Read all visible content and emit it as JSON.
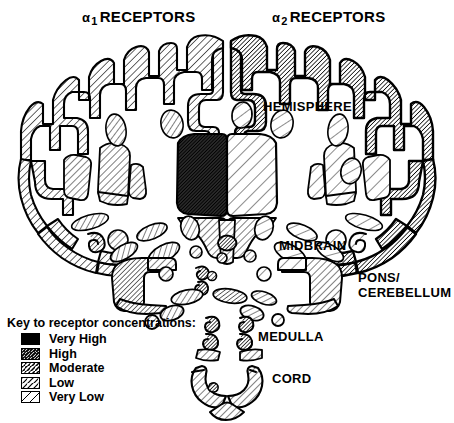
{
  "figure": {
    "type": "anatomical-diagram",
    "titles": {
      "left": {
        "alpha": "α",
        "subscript": "1",
        "word": "RECEPTORS",
        "full": "α1 RECEPTORS"
      },
      "right": {
        "alpha": "α",
        "subscript": "2",
        "word": "RECEPTORS",
        "full": "α2 RECEPTORS"
      }
    },
    "annotations": {
      "hemisphere": "HEMISPHERE",
      "midbrain": "MIDBRAIN",
      "pons_line1": "PONS/",
      "pons_line2": "CEREBELLUM",
      "medulla": "MEDULLA",
      "cord": "CORD"
    }
  },
  "legend": {
    "title": "Key to receptor concentrations:",
    "items": [
      {
        "label": "Very High",
        "level": 5,
        "fill": "#111111"
      },
      {
        "label": "High",
        "level": 4,
        "fill": "#3c3c3c"
      },
      {
        "label": "Moderate",
        "level": 3,
        "fill": "#6e6e6e"
      },
      {
        "label": "Low",
        "level": 2,
        "fill": "#a8a8a8"
      },
      {
        "label": "Very Low",
        "level": 1,
        "fill": "#ffffff"
      }
    ]
  },
  "colors": {
    "ink": "#000000",
    "background": "#ffffff"
  }
}
